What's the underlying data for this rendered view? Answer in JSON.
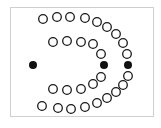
{
  "diagram": {
    "frame": {
      "x": 10,
      "y": 7,
      "w": 144,
      "h": 110,
      "stroke": "#cfcfcf"
    },
    "open_circle": {
      "r": 4.3,
      "stroke": "#1a1a1a",
      "stroke_width": 1.3,
      "fill": "#ffffff"
    },
    "solid_dot": {
      "r": 4,
      "fill": "#111111"
    },
    "outer_arc": [
      [
        43,
        19
      ],
      [
        57,
        17
      ],
      [
        70,
        17
      ],
      [
        85,
        18
      ],
      [
        97,
        22
      ],
      [
        107,
        27
      ],
      [
        116,
        34
      ],
      [
        123,
        43
      ],
      [
        127,
        54
      ],
      [
        128,
        76
      ],
      [
        123,
        85
      ],
      [
        116,
        92
      ],
      [
        107,
        98
      ],
      [
        97,
        103
      ],
      [
        85,
        107
      ],
      [
        71,
        109
      ],
      [
        58,
        108
      ],
      [
        42,
        106
      ]
    ],
    "inner_arc": [
      [
        53,
        42
      ],
      [
        67,
        41
      ],
      [
        81,
        42
      ],
      [
        93,
        44
      ],
      [
        101,
        54
      ],
      [
        101,
        77
      ],
      [
        93,
        84
      ],
      [
        81,
        89
      ],
      [
        67,
        90
      ],
      [
        53,
        89
      ]
    ],
    "solid_points": [
      [
        33,
        65
      ],
      [
        104,
        65
      ],
      [
        128,
        65
      ]
    ]
  }
}
